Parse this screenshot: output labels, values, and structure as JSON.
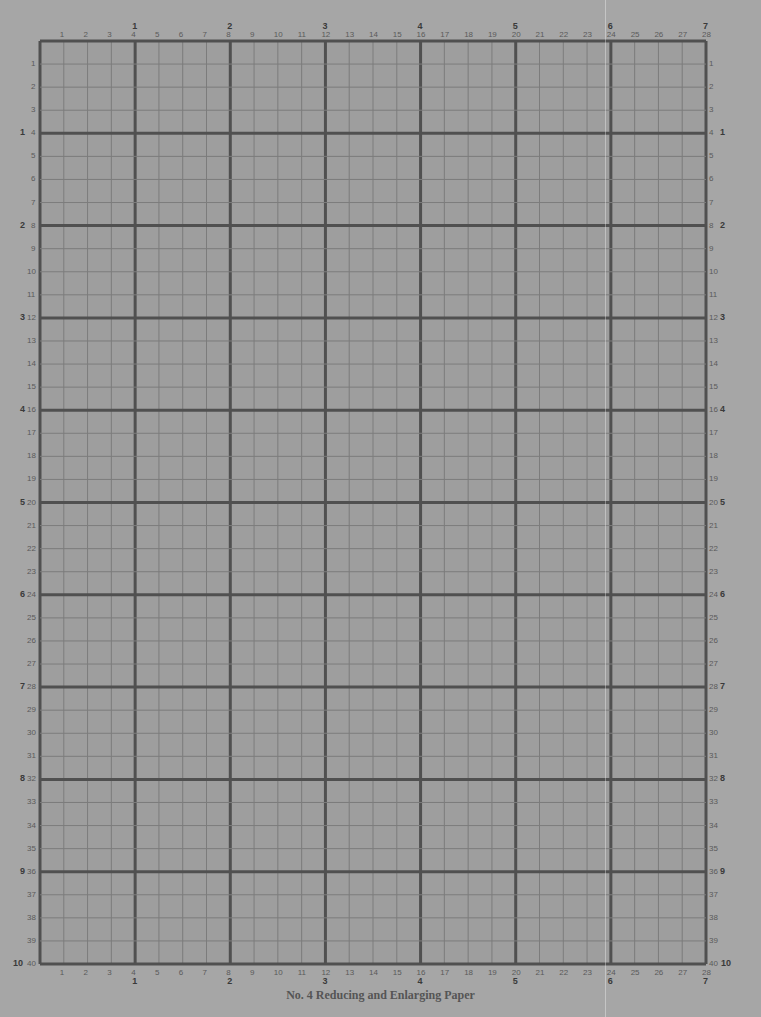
{
  "paper": {
    "title": "No. 4 Reducing and Enlarging Paper",
    "columns": 28,
    "rows": 40,
    "major_every": 4,
    "grid": {
      "left": 40,
      "top": 41,
      "right": 706,
      "bottom": 964
    },
    "colors": {
      "background": "#a6a6a6",
      "grid_fill": "#9e9e9e",
      "minor_line": "#7c7c7c",
      "major_line": "#505050",
      "label": "#5a5a5a"
    },
    "column_labels": [
      "1",
      "2",
      "3",
      "4",
      "5",
      "6",
      "7",
      "8",
      "9",
      "10",
      "11",
      "12",
      "13",
      "14",
      "15",
      "16",
      "17",
      "18",
      "19",
      "20",
      "21",
      "22",
      "23",
      "24",
      "25",
      "26",
      "27",
      "28"
    ],
    "column_major_labels": [
      "1",
      "2",
      "3",
      "4",
      "5",
      "6",
      "7"
    ],
    "row_labels": [
      "1",
      "2",
      "3",
      "4",
      "5",
      "6",
      "7",
      "8",
      "9",
      "10",
      "11",
      "12",
      "13",
      "14",
      "15",
      "16",
      "17",
      "18",
      "19",
      "20",
      "21",
      "22",
      "23",
      "24",
      "25",
      "26",
      "27",
      "28",
      "29",
      "30",
      "31",
      "32",
      "33",
      "34",
      "35",
      "36",
      "37",
      "38",
      "39",
      "40"
    ],
    "row_major_labels": [
      "1",
      "2",
      "3",
      "4",
      "5",
      "6",
      "7",
      "8",
      "9",
      "10"
    ]
  }
}
